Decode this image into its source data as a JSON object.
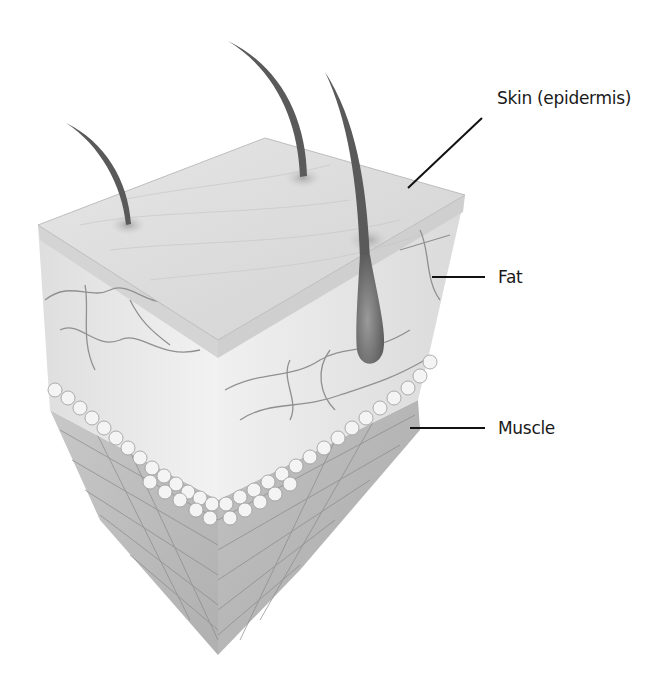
{
  "diagram": {
    "labels": [
      {
        "id": "skin",
        "text": "Skin (epidermis)",
        "target": "top surface layer"
      },
      {
        "id": "fat",
        "text": "Fat",
        "target": "middle fatty layer"
      },
      {
        "id": "muscle",
        "text": "Muscle",
        "target": "bottom muscle layer"
      }
    ],
    "layers_top_to_bottom": [
      "Skin (epidermis)",
      "Fat",
      "Muscle"
    ],
    "features": [
      "3 hairs",
      "1 hair follicle bulb",
      "blood vessels",
      "fat cells",
      "muscle fibers"
    ],
    "colors": {
      "background": "#ffffff",
      "label_text": "#1a1a1a",
      "leader_line": "#111111",
      "hair": "#5a5a5a"
    }
  }
}
